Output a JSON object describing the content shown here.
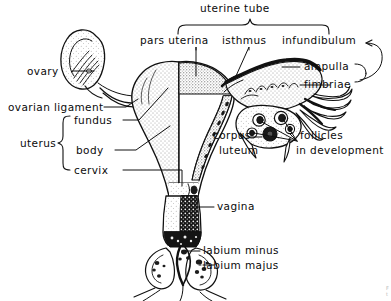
{
  "figure": {
    "style": "black ink line drawing with stipple shading on white background",
    "ink_color": "#111111",
    "background_color": "#ffffff",
    "corner_caption_fragment": "F\nt"
  },
  "labels": {
    "uterine_tube": "uterine tube",
    "pars_uterina": "pars uterina",
    "isthmus": "isthmus",
    "infundibulum": "infundibulum",
    "ampulla": "ampulla",
    "fimbriae": "fimbriae",
    "ovary": "ovary",
    "ovarian_ligament": "ovarian ligament",
    "uterus": "uterus",
    "fundus": "fundus",
    "body": "body",
    "cervix": "cervix",
    "corpus_luteum_line1": "corpus",
    "corpus_luteum_line2": "luteum",
    "follicles_line1": "follicles",
    "follicles_line2": "in development",
    "vagina": "vagina",
    "labium_minus": "labium minus",
    "labium_majus": "labium majus"
  },
  "braces": {
    "uterine_tube_brace": "top brace spanning pars uterina, isthmus and infundibulum",
    "uterus_brace": "left brace grouping fundus, body and cervix"
  },
  "structures": [
    {
      "name": "ovary-left",
      "description": "left ovary, elongated oval with internal follicle striations"
    },
    {
      "name": "ovarian-ligament",
      "description": "cord connecting left ovary to uterine fundus"
    },
    {
      "name": "uterus-body",
      "description": "pear-shaped uterus, left half external surface, right half cut open showing cavity"
    },
    {
      "name": "uterine-cavity",
      "description": "triangular uterine cavity with stippled endometrium"
    },
    {
      "name": "cervix",
      "description": "narrow lower uterine segment"
    },
    {
      "name": "vagina",
      "description": "vaginal canal opened longitudinally with rugae"
    },
    {
      "name": "uterine-tube-left",
      "description": "left uterine tube running to left ovary"
    },
    {
      "name": "uterine-tube-right",
      "description": "right uterine tube, sectioned, showing mucosal folds"
    },
    {
      "name": "ampulla",
      "description": "widened distal portion of right uterine tube"
    },
    {
      "name": "infundibulum",
      "description": "funnel-shaped end of right uterine tube"
    },
    {
      "name": "fimbriae",
      "description": "finger-like fringe at the infundibulum"
    },
    {
      "name": "ovary-right",
      "description": "right ovary sectioned, showing follicles and corpus luteum"
    },
    {
      "name": "follicles",
      "description": "several developing follicles inside right ovary"
    },
    {
      "name": "corpus-luteum",
      "description": "corpus luteum within right ovary"
    },
    {
      "name": "labium-majus",
      "description": "outer labial fold"
    },
    {
      "name": "labium-minus",
      "description": "inner labial fold"
    }
  ]
}
